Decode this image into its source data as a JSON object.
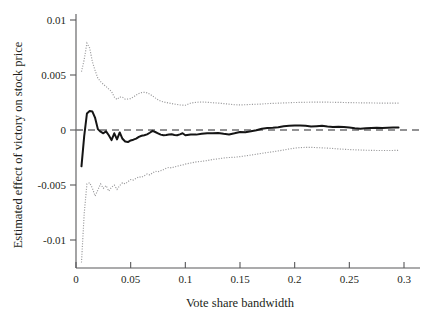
{
  "chart_data": {
    "type": "line",
    "title": "",
    "subtitle": "",
    "xlabel": "Vote share bandwidth",
    "ylabel": "Estimated effect of victory on stock price",
    "xlim": [
      0.0,
      0.3
    ],
    "ylim": [
      -0.0125,
      0.0105
    ],
    "xticks": [
      0,
      0.05,
      0.1,
      0.15,
      0.2,
      0.25,
      0.3
    ],
    "xtick_labels": [
      "0",
      "0.05",
      "0.1",
      "0.15",
      "0.2",
      "0.25",
      "0.3"
    ],
    "yticks": [
      0.01,
      0.005,
      0,
      -0.005,
      -0.01
    ],
    "ytick_labels": [
      "0.01",
      "0.005",
      "0",
      "-0.005",
      "-0.01"
    ],
    "grid": false,
    "legend": "none",
    "annotations": [
      "horizontal dashed reference line at y = 0"
    ],
    "x": [
      0.005,
      0.0075,
      0.01,
      0.0125,
      0.015,
      0.0175,
      0.02,
      0.0225,
      0.025,
      0.0275,
      0.03,
      0.0325,
      0.035,
      0.0375,
      0.04,
      0.0425,
      0.045,
      0.0475,
      0.05,
      0.0525,
      0.055,
      0.0575,
      0.06,
      0.0625,
      0.065,
      0.0675,
      0.07,
      0.0725,
      0.075,
      0.0775,
      0.08,
      0.0825,
      0.085,
      0.0875,
      0.09,
      0.0925,
      0.095,
      0.0975,
      0.1,
      0.105,
      0.11,
      0.115,
      0.12,
      0.125,
      0.13,
      0.135,
      0.14,
      0.145,
      0.15,
      0.155,
      0.16,
      0.165,
      0.17,
      0.175,
      0.18,
      0.185,
      0.19,
      0.195,
      0.2,
      0.205,
      0.21,
      0.215,
      0.22,
      0.225,
      0.23,
      0.235,
      0.24,
      0.245,
      0.25,
      0.255,
      0.26,
      0.265,
      0.27,
      0.275,
      0.28,
      0.285,
      0.29,
      0.295
    ],
    "series": [
      {
        "name": "Point estimate",
        "style": "solid",
        "values": [
          -0.0033,
          -0.00055,
          0.0015,
          0.00172,
          0.00168,
          0.0011,
          8e-05,
          -0.00015,
          -0.0003,
          -0.00012,
          -0.00048,
          -0.00092,
          -0.0003,
          -0.00085,
          -0.00022,
          -0.0008,
          -0.00105,
          -0.0011,
          -0.00095,
          -0.00088,
          -0.00078,
          -0.00062,
          -0.00052,
          -0.00048,
          -0.0004,
          -0.00025,
          -8e-05,
          -0.00018,
          -0.0003,
          -0.00042,
          -0.00048,
          -0.00045,
          -0.0004,
          -0.00038,
          -0.00045,
          -0.00048,
          -0.0004,
          -0.0003,
          -0.00048,
          -0.0004,
          -0.00042,
          -0.00035,
          -0.0003,
          -0.0003,
          -0.00028,
          -0.00035,
          -0.0004,
          -0.0003,
          -0.00018,
          -0.0002,
          -0.00012,
          -2e-05,
          0.00012,
          0.00018,
          0.0002,
          0.00025,
          0.00035,
          0.00038,
          0.00042,
          0.0004,
          0.00038,
          0.00032,
          0.00035,
          0.00038,
          0.00032,
          0.00028,
          0.0003,
          0.00028,
          0.00022,
          0.00015,
          0.00012,
          0.00015,
          0.00018,
          0.0002,
          0.00018,
          0.0002,
          0.00022,
          0.00022
        ]
      },
      {
        "name": "Upper 95% confidence bound",
        "style": "dotted",
        "values": [
          0.0053,
          0.0064,
          0.0079,
          0.00745,
          0.0062,
          0.0054,
          0.0047,
          0.0044,
          0.00415,
          0.00395,
          0.00372,
          0.0035,
          0.003,
          0.00278,
          0.003,
          0.00298,
          0.0028,
          0.00282,
          0.00285,
          0.003,
          0.00318,
          0.00332,
          0.0034,
          0.00342,
          0.00338,
          0.00325,
          0.0031,
          0.00292,
          0.00275,
          0.00262,
          0.00255,
          0.0025,
          0.00245,
          0.0024,
          0.00236,
          0.00232,
          0.00228,
          0.00226,
          0.00225,
          0.00245,
          0.00252,
          0.00255,
          0.00252,
          0.00248,
          0.00245,
          0.0024,
          0.00235,
          0.0023,
          0.00228,
          0.0023,
          0.00232,
          0.00234,
          0.00236,
          0.0024,
          0.00242,
          0.00244,
          0.00246,
          0.00248,
          0.0025,
          0.00251,
          0.00252,
          0.00253,
          0.00254,
          0.00254,
          0.00253,
          0.00252,
          0.00251,
          0.0025,
          0.00249,
          0.00248,
          0.00247,
          0.00246,
          0.00246,
          0.00245,
          0.00245,
          0.00245,
          0.00245,
          0.00245
        ]
      },
      {
        "name": "Lower 95% confidence bound",
        "style": "dotted",
        "values": [
          -0.01205,
          -0.0076,
          -0.0049,
          -0.0048,
          -0.0053,
          -0.006,
          -0.00545,
          -0.0049,
          -0.0053,
          -0.00505,
          -0.00555,
          -0.0052,
          -0.005,
          -0.0054,
          -0.00505,
          -0.0048,
          -0.0049,
          -0.0047,
          -0.0045,
          -0.00455,
          -0.0044,
          -0.00425,
          -0.0043,
          -0.00415,
          -0.004,
          -0.00408,
          -0.0039,
          -0.00375,
          -0.0038,
          -0.0037,
          -0.0036,
          -0.00348,
          -0.0034,
          -0.00345,
          -0.00335,
          -0.0033,
          -0.00322,
          -0.00318,
          -0.0031,
          -0.003,
          -0.0029,
          -0.00285,
          -0.00278,
          -0.00268,
          -0.00262,
          -0.00255,
          -0.0025,
          -0.00248,
          -0.00242,
          -0.00235,
          -0.00228,
          -0.0022,
          -0.00212,
          -0.00205,
          -0.00198,
          -0.0019,
          -0.00182,
          -0.00172,
          -0.00165,
          -0.0016,
          -0.00158,
          -0.00158,
          -0.0016,
          -0.00162,
          -0.00165,
          -0.00168,
          -0.00172,
          -0.00175,
          -0.00178,
          -0.0018,
          -0.00182,
          -0.00184,
          -0.00185,
          -0.00186,
          -0.00186,
          -0.00186,
          -0.00186,
          -0.00185
        ]
      }
    ]
  },
  "colors": {
    "estimate": "#151515",
    "confidence": "#9a9a9c",
    "zero_reference": "#6f6f71",
    "axis": "#58585a",
    "text": "#231f20",
    "background": "#ffffff"
  }
}
